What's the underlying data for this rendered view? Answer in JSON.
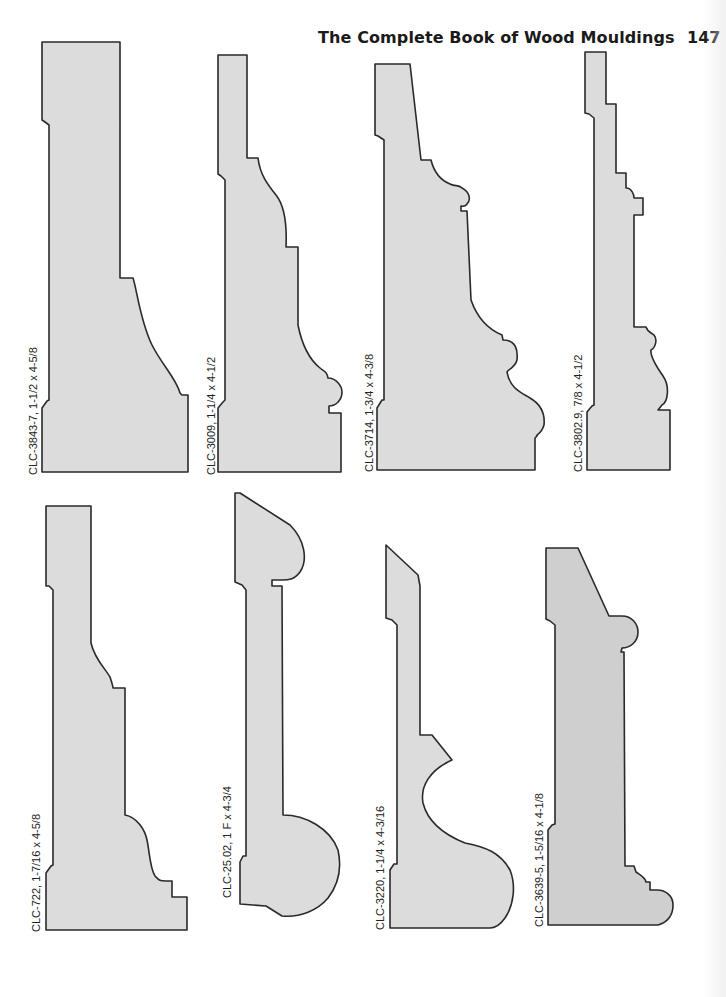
{
  "header": {
    "title": "The Complete Book of Wood Mouldings",
    "page_number": "147"
  },
  "profiles": [
    {
      "id": "CLC-3843-7",
      "size": "1-1/2 x 4-5/8",
      "label": "CLC-3843-7,  1-1/2 x 4-5/8",
      "row": 1,
      "col": 1
    },
    {
      "id": "CLC-3009",
      "size": "1-1/4 x 4-1/2",
      "label": "CLC-3009,  1-1/4 x 4-1/2",
      "row": 1,
      "col": 2
    },
    {
      "id": "CLC-3714",
      "size": "1-3/4 x 4-3/8",
      "label": "CLC-3714,  1-3/4 x 4-3/8",
      "row": 1,
      "col": 3
    },
    {
      "id": "CLC-3802.9",
      "size": "7/8 x 4-1/2",
      "label": "CLC-3802.9,  7/8 x 4-1/2",
      "row": 1,
      "col": 4
    },
    {
      "id": "CLC-722",
      "size": "1-7/16 x 4-5/8",
      "label": "CLC-722,  1-7/16 x 4-5/8",
      "row": 2,
      "col": 1
    },
    {
      "id": "CLC-25.02",
      "size": "1 F x 4-3/4",
      "label": "CLC-25.02, 1 F x 4-3/4",
      "row": 2,
      "col": 2
    },
    {
      "id": "CLC-3220",
      "size": "1-1/4 x 4-3/16",
      "label": "CLC-3220,  1-1/4 x 4-3/16",
      "row": 2,
      "col": 3
    },
    {
      "id": "CLC-3639-5",
      "size": "1-5/16 x 4-1/8",
      "label": "CLC-3639-5,  1-5/16 x 4-1/8",
      "row": 2,
      "col": 4
    }
  ],
  "colors": {
    "profile_fill": "#dcdcdc",
    "profile_stroke": "#2a2a2a",
    "text": "#1a1a1a"
  }
}
